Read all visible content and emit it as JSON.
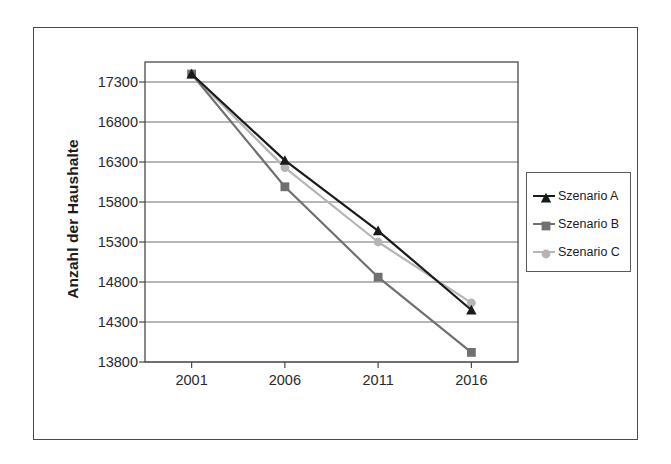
{
  "chart_data": {
    "type": "line",
    "title": "",
    "subtitle": "",
    "xlabel": "",
    "ylabel": "Anzahl der Haushalte",
    "categories": [
      "2001",
      "2006",
      "2011",
      "2016"
    ],
    "x": [
      2001,
      2006,
      2011,
      2016
    ],
    "series": [
      {
        "name": "Szenario A",
        "marker": "triangle",
        "color": "#1a1a1a",
        "values": [
          17400,
          16320,
          15440,
          14450
        ]
      },
      {
        "name": "Szenario B",
        "marker": "square",
        "color": "#707070",
        "values": [
          17400,
          15990,
          14860,
          13920
        ]
      },
      {
        "name": "Szenario C",
        "marker": "circle",
        "color": "#b5b5b5",
        "values": [
          17400,
          16230,
          15300,
          14540
        ]
      }
    ],
    "ylim": [
      13800,
      17550
    ],
    "y_ticks": [
      13800,
      14300,
      14800,
      15300,
      15800,
      16300,
      16800,
      17300
    ],
    "y_tick_labels": [
      "13800",
      "14300",
      "14800",
      "15300",
      "15800",
      "16300",
      "16800",
      "17300"
    ],
    "x_tick_labels": [
      "2001",
      "2006",
      "2011",
      "2016"
    ],
    "grid": "horizontal",
    "legend_position": "right",
    "legend_entries": [
      "Szenario A",
      "Szenario B",
      "Szenario C"
    ]
  },
  "colors": {
    "series_a": "#1a1a1a",
    "series_b": "#707070",
    "series_c": "#b5b5b5",
    "gridline": "#6e6e6e",
    "axis": "#4a4a4a",
    "frame": "#4a4a4a",
    "background": "#ffffff",
    "text": "#1c1c1c"
  }
}
